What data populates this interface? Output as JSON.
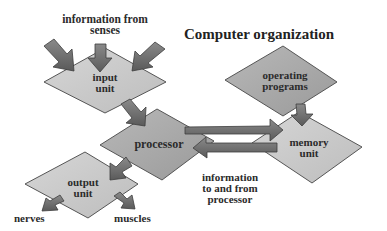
{
  "title": "Computer organization",
  "nodes": {
    "input_unit": {
      "line1": "input",
      "line2": "unit"
    },
    "operating_programs": {
      "line1": "operating",
      "line2": "programs"
    },
    "processor": {
      "label": "processor"
    },
    "memory_unit": {
      "line1": "memory",
      "line2": "unit"
    },
    "output_unit": {
      "line1": "output",
      "line2": "unit"
    }
  },
  "labels": {
    "senses": {
      "line1": "information from",
      "line2": "senses"
    },
    "info_to_from": {
      "line1": "information",
      "line2": "to and from",
      "line3": "processor"
    },
    "nerves": "nerves",
    "muscles": "muscles"
  },
  "edges": [
    {
      "from": "senses",
      "to": "input_unit",
      "count": 3
    },
    {
      "from": "input_unit",
      "to": "processor"
    },
    {
      "from": "processor",
      "to": "memory_unit"
    },
    {
      "from": "memory_unit",
      "to": "processor"
    },
    {
      "from": "operating_programs",
      "to": "memory_unit"
    },
    {
      "from": "processor",
      "to": "output_unit"
    },
    {
      "from": "output_unit",
      "to": "nerves"
    },
    {
      "from": "output_unit",
      "to": "muscles"
    }
  ],
  "colors": {
    "light_diamond": "#c9c9c9",
    "mid_diamond": "#a8a8a8",
    "arrow": "#6f6f6f",
    "arrow_dark": "#555555",
    "outline": "#4a4a4a"
  }
}
